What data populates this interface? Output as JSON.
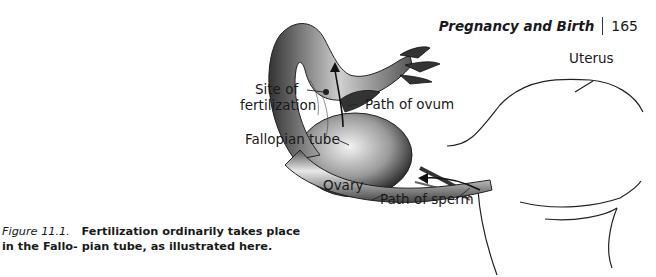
{
  "header": {
    "running_title": "Pregnancy and Birth",
    "page_number": "165"
  },
  "figure": {
    "labels": {
      "uterus": "Uterus",
      "site_of_fertilization_line1": "Site of",
      "site_of_fertilization_line2": "fertilization",
      "path_of_ovum": "Path of ovum",
      "fallopian_tube": "Fallopian tube",
      "ovary": "Ovary",
      "path_of_sperm": "Path of sperm"
    },
    "caption": {
      "number": "Figure 11.1.",
      "text": "Fertilization ordinarily takes place in the Fallo- pian tube, as illustrated here."
    }
  }
}
